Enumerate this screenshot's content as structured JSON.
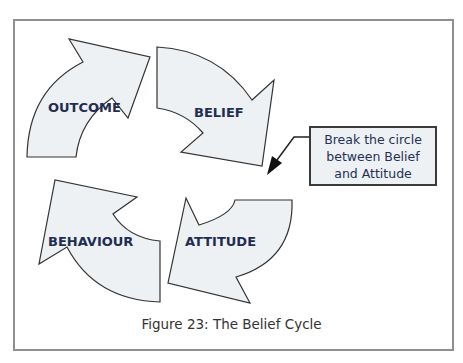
{
  "diagram": {
    "nodes": [
      {
        "id": "outcome",
        "label": "OUTCOME"
      },
      {
        "id": "belief",
        "label": "BELIEF"
      },
      {
        "id": "attitude",
        "label": "ATTITUDE"
      },
      {
        "id": "behaviour",
        "label": "BEHAVIOUR"
      }
    ],
    "edges": [
      {
        "from": "outcome",
        "to": "belief"
      },
      {
        "from": "belief",
        "to": "attitude"
      },
      {
        "from": "attitude",
        "to": "behaviour"
      },
      {
        "from": "behaviour",
        "to": "outcome"
      }
    ],
    "callout": {
      "text": "Break the circle between Belief and Attitude",
      "lines": [
        "Break the circle",
        "between Belief",
        "and Attitude"
      ],
      "points_to": "gap between Belief and Attitude"
    },
    "caption": "Figure 23: The Belief Cycle"
  },
  "colors": {
    "arrow_fill": "#eef1f3",
    "arrow_stroke": "#333333",
    "label_text": "#1f2d52",
    "frame_border": "#8f8f8f"
  }
}
